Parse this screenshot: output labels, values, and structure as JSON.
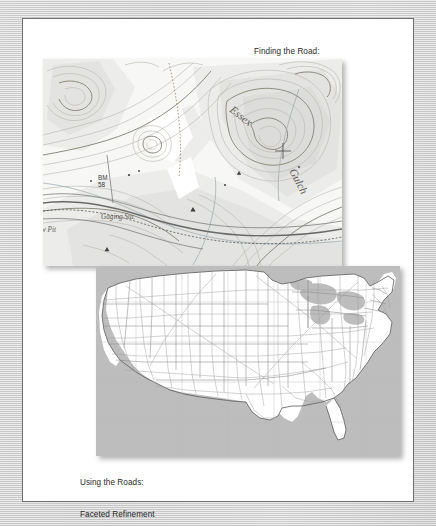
{
  "page": {
    "background_color": "#c9c9c9",
    "panel_color": "#ffffff",
    "panel_border_color": "#6e6e6e"
  },
  "figures": [
    {
      "id": "topographic-map",
      "caption_lines": [
        "Finding the Road:",
        "Query Disambiguation"
      ],
      "map_type": "usgs-topographic-quadrangle",
      "labels": [
        {
          "text": "Essex",
          "style": "italic-serif"
        },
        {
          "text": "Gulch",
          "style": "italic-serif"
        },
        {
          "text": "BM",
          "style": "sans"
        },
        {
          "text": "58",
          "style": "sans"
        },
        {
          "text": "Gaging Sta.",
          "style": "italic-serif"
        },
        {
          "text": "w Pit",
          "style": "italic-serif"
        }
      ]
    },
    {
      "id": "united-states-road-map",
      "caption_lines": [
        "Using the Roads:",
        "Faceted Refinement"
      ],
      "map_type": "national-highway-network",
      "labels": []
    }
  ],
  "captions": {
    "top": {
      "line1": "Finding the Road:",
      "line2": "Query Disambiguation"
    },
    "bottom": {
      "line1": "Using the Roads:",
      "line2": "Faceted Refinement"
    }
  },
  "topo": {
    "essex": "Essex",
    "gulch": "Gulch",
    "bm": "BM",
    "bm_elevation": "58",
    "gaging_station": "Gaging Sta.",
    "pit": "w Pit"
  },
  "colors": {
    "caption_text": "#2b2b2b",
    "ocean": "#bdbdbd",
    "land": "#ffffff",
    "contour": "#b9b5ac",
    "contour_index": "#8e8a80",
    "state_border": "#8a8a8a",
    "road": "#9c9c9c"
  }
}
